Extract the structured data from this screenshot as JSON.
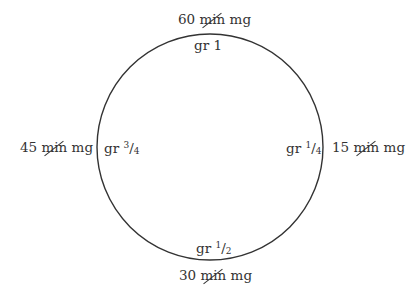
{
  "diagram": {
    "type": "dosage-equivalence-clock",
    "circle": {
      "cx": 210,
      "cy": 147,
      "r": 113,
      "stroke": "#333333"
    },
    "outer_labels": {
      "top": {
        "value": "60",
        "struck": "min",
        "unit": "mg"
      },
      "right": {
        "value": "15",
        "struck": "min",
        "unit": "mg"
      },
      "bottom": {
        "value": "30",
        "struck": "min",
        "unit": "mg"
      },
      "left": {
        "value": "45",
        "struck": "min",
        "unit": "mg"
      }
    },
    "inner_labels": {
      "top": {
        "prefix": "gr",
        "whole": "1",
        "num": "",
        "den": ""
      },
      "right": {
        "prefix": "gr",
        "whole": "",
        "num": "1",
        "den": "4"
      },
      "bottom": {
        "prefix": "gr",
        "whole": "",
        "num": "1",
        "den": "2"
      },
      "left": {
        "prefix": "gr",
        "whole": "",
        "num": "3",
        "den": "4"
      }
    }
  }
}
